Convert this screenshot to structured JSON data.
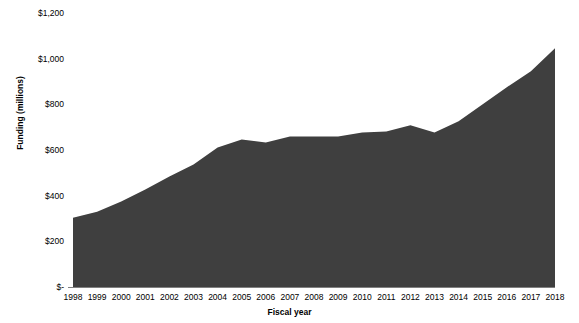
{
  "chart_data": {
    "type": "area",
    "title": "",
    "xlabel": "Fiscal year",
    "ylabel": "Funding (millions)",
    "x": [
      1998,
      1999,
      2000,
      2001,
      2002,
      2003,
      2004,
      2005,
      2006,
      2007,
      2008,
      2009,
      2010,
      2011,
      2012,
      2013,
      2014,
      2015,
      2016,
      2017,
      2018
    ],
    "categories": [
      "1998",
      "1999",
      "2000",
      "2001",
      "2002",
      "2003",
      "2004",
      "2005",
      "2006",
      "2007",
      "2008",
      "2009",
      "2010",
      "2011",
      "2012",
      "2013",
      "2014",
      "2015",
      "2016",
      "2017",
      "2018"
    ],
    "values": [
      303,
      330,
      374,
      427,
      484,
      536,
      611,
      646,
      633,
      659,
      659,
      659,
      677,
      681,
      708,
      677,
      726,
      800,
      875,
      945,
      1046
    ],
    "series": [
      {
        "name": "Funding",
        "values": [
          303,
          330,
          374,
          427,
          484,
          536,
          611,
          646,
          633,
          659,
          659,
          659,
          677,
          681,
          708,
          677,
          726,
          800,
          875,
          945,
          1046
        ]
      }
    ],
    "ylim": [
      0,
      1200
    ],
    "y_ticks": [
      0,
      200,
      400,
      600,
      800,
      1000,
      1200
    ],
    "y_tick_labels": [
      "$-",
      "$200",
      "$400",
      "$600",
      "$800",
      "$1,000",
      "$1,200"
    ],
    "grid": false,
    "legend": "none",
    "area_color": "#3f3f3f",
    "axis_color": "#808080",
    "text_color": "#000000"
  },
  "axes": {
    "y_title": "Funding (millions)",
    "x_title": "Fiscal year",
    "y_labels": [
      "$1,200",
      "$1,000",
      "$800",
      "$600",
      "$400",
      "$200",
      "$-"
    ],
    "x_labels": [
      "1998",
      "1999",
      "2000",
      "2001",
      "2002",
      "2003",
      "2004",
      "2005",
      "2006",
      "2007",
      "2008",
      "2009",
      "2010",
      "2011",
      "2012",
      "2013",
      "2014",
      "2015",
      "2016",
      "2017",
      "2018"
    ]
  }
}
